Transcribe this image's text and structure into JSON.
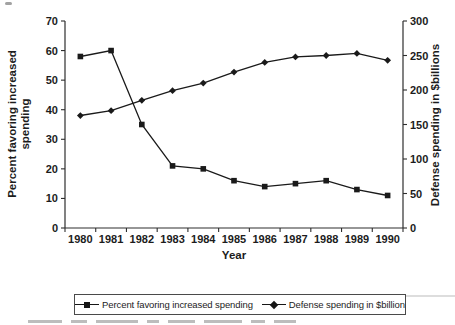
{
  "chart_data": {
    "type": "line",
    "title": "",
    "xlabel": "Year",
    "grid": false,
    "legend_position": "bottom",
    "line_color": "#1a1a1a",
    "categories": [
      "1980",
      "1981",
      "1982",
      "1983",
      "1984",
      "1985",
      "1986",
      "1987",
      "1988",
      "1989",
      "1990"
    ],
    "left_axis": {
      "label_lines": [
        "Percent favoring increased",
        "spending"
      ],
      "min": 0,
      "max": 70,
      "ticks": [
        0,
        10,
        20,
        30,
        40,
        50,
        60,
        70
      ]
    },
    "right_axis": {
      "label": "Defense spending in $billions",
      "min": 0,
      "max": 300,
      "ticks": [
        0,
        50,
        100,
        150,
        200,
        250,
        300
      ]
    },
    "series": [
      {
        "name": "Percent favoring increased spending",
        "axis": "left",
        "marker": "square",
        "color": "#1a1a1a",
        "values": [
          58,
          60,
          35,
          21,
          20,
          16,
          14,
          15,
          16,
          13,
          11
        ]
      },
      {
        "name": "Defense spending in $billion",
        "axis": "right",
        "marker": "diamond",
        "color": "#1a1a1a",
        "values": [
          163,
          170,
          185,
          199,
          210,
          226,
          240,
          248,
          250,
          253,
          243
        ]
      }
    ]
  }
}
